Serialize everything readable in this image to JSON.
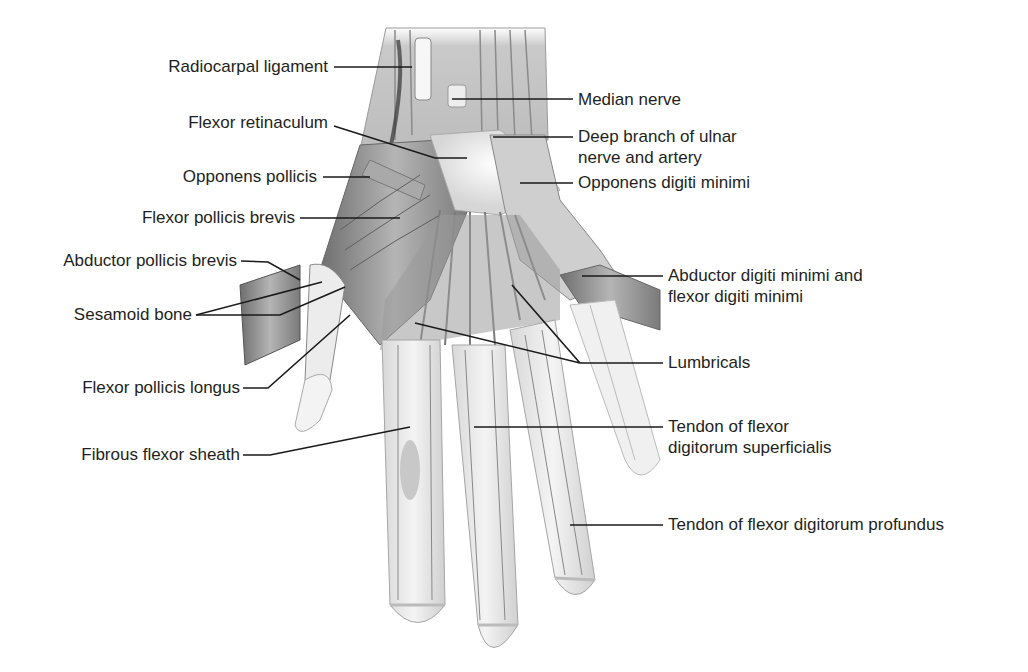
{
  "figure": {
    "colors": {
      "background": "#ffffff",
      "text": "#231f20",
      "leader": "#1a1a1a",
      "muscle": "#8c8c8c",
      "skin": "#ededed"
    }
  },
  "labels_left": [
    {
      "id": "radiocarpal-ligament",
      "text": "Radiocarpal ligament"
    },
    {
      "id": "flexor-retinaculum",
      "text": "Flexor retinaculum"
    },
    {
      "id": "opponens-pollicis",
      "text": "Opponens pollicis"
    },
    {
      "id": "flexor-pollicis-brevis",
      "text": "Flexor pollicis brevis"
    },
    {
      "id": "abductor-pollicis-brevis",
      "text": "Abductor pollicis brevis"
    },
    {
      "id": "sesamoid-bone",
      "text": "Sesamoid bone"
    },
    {
      "id": "flexor-pollicis-longus",
      "text": "Flexor pollicis longus"
    },
    {
      "id": "fibrous-flexor-sheath",
      "text": "Fibrous flexor sheath"
    }
  ],
  "labels_right": [
    {
      "id": "median-nerve",
      "text": "Median nerve"
    },
    {
      "id": "deep-branch-ulnar",
      "text": "Deep branch of ulnar",
      "text2": "nerve and artery"
    },
    {
      "id": "opponens-digiti-minimi",
      "text": "Opponens digiti minimi"
    },
    {
      "id": "abductor-digiti-minimi",
      "text": "Abductor digiti minimi and",
      "text2": "flexor digiti minimi"
    },
    {
      "id": "lumbricals",
      "text": "Lumbricals"
    },
    {
      "id": "tendon-fds",
      "text": "Tendon of flexor",
      "text2": "digitorum superficialis"
    },
    {
      "id": "tendon-fdp",
      "text": "Tendon of flexor digitorum profundus"
    }
  ]
}
